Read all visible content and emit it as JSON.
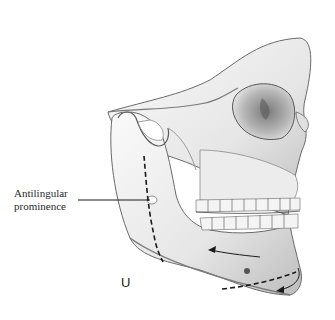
{
  "figure": {
    "labels": {
      "antilingular": "Antilingular\nprominence"
    },
    "panel_letter": "U",
    "colors": {
      "bone_light": "#f2f2f2",
      "bone_mid": "#cfcfcf",
      "bone_shadow": "#8a8a8a",
      "line": "#1a1a1a"
    }
  }
}
